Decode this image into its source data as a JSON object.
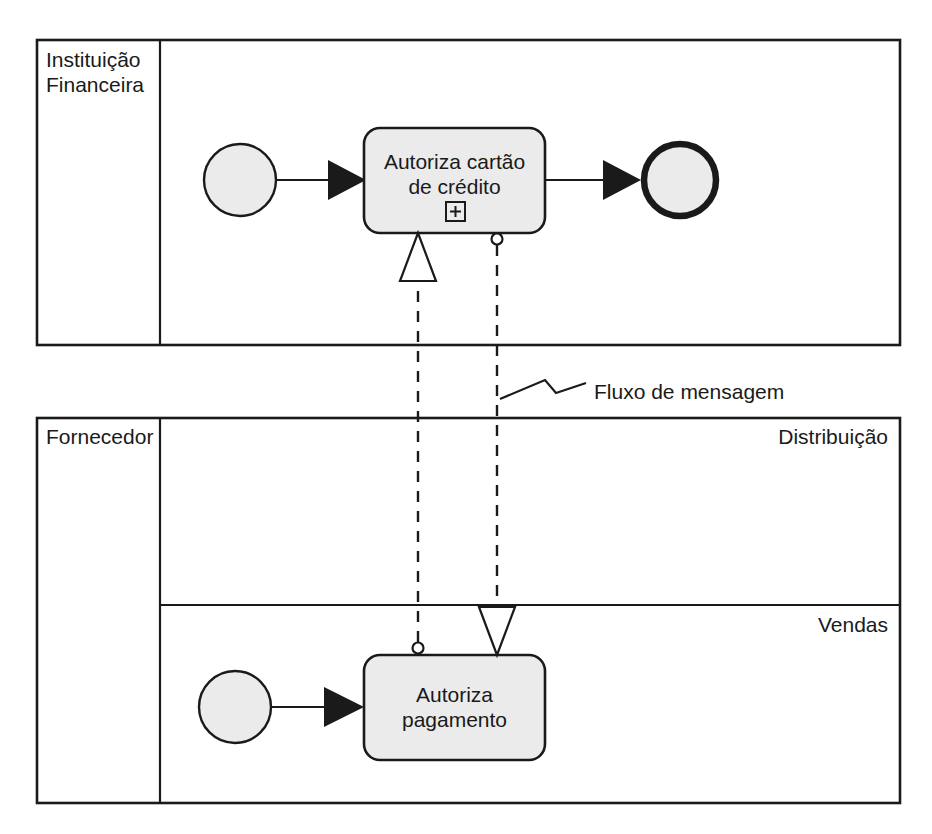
{
  "diagram": {
    "type": "bpmn-collaboration",
    "notation": "BPMN",
    "background_color": "#ffffff",
    "line_color": "#1a1a1a",
    "shape_fill": "#ebebeb"
  },
  "pools": [
    {
      "id": "pool-instituicao-financeira",
      "label": "Instituição Financeira",
      "label_lines": [
        "Instituição",
        "Financeira"
      ],
      "lanes": [],
      "elements": [
        {
          "id": "start-event-1",
          "type": "start-event",
          "label": ""
        },
        {
          "id": "task-autoriza-cartao",
          "type": "sub-process",
          "label": "Autoriza cartão de crédito",
          "label_lines": [
            "Autoriza cartão",
            "de crédito"
          ],
          "marker": "sub-process-plus"
        },
        {
          "id": "end-event-1",
          "type": "end-event",
          "label": ""
        }
      ]
    },
    {
      "id": "pool-fornecedor",
      "label": "Fornecedor",
      "label_lines": [
        "Fornecedor"
      ],
      "lanes": [
        {
          "id": "lane-distribuicao",
          "label": "Distribuição"
        },
        {
          "id": "lane-vendas",
          "label": "Vendas"
        }
      ],
      "elements": [
        {
          "id": "start-event-2",
          "type": "start-event",
          "label": ""
        },
        {
          "id": "task-autoriza-pagamento",
          "type": "task",
          "label": "Autoriza pagamento",
          "label_lines": [
            "Autoriza",
            "pagamento"
          ],
          "marker": "none"
        }
      ]
    }
  ],
  "connections": [
    {
      "id": "seq-flow-1",
      "type": "sequence-flow",
      "from": "start-event-1",
      "to": "task-autoriza-cartao",
      "style": "solid-filled-arrow"
    },
    {
      "id": "seq-flow-2",
      "type": "sequence-flow",
      "from": "task-autoriza-cartao",
      "to": "end-event-1",
      "style": "solid-filled-arrow"
    },
    {
      "id": "seq-flow-3",
      "type": "sequence-flow",
      "from": "start-event-2",
      "to": "task-autoriza-pagamento",
      "style": "solid-filled-arrow"
    },
    {
      "id": "msg-flow-1",
      "type": "message-flow",
      "from": "task-autoriza-pagamento",
      "to": "task-autoriza-cartao",
      "style": "dashed-hollow-arrow"
    },
    {
      "id": "msg-flow-2",
      "type": "message-flow",
      "from": "task-autoriza-cartao",
      "to": "task-autoriza-pagamento",
      "style": "dashed-hollow-arrow"
    }
  ],
  "annotations": [
    {
      "id": "annotation-message-flow",
      "label": "Fluxo de mensagem",
      "target": "msg-flow-2"
    }
  ]
}
